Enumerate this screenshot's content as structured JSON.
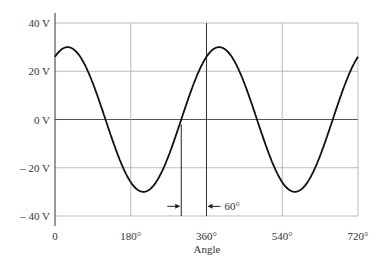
{
  "chart_data": {
    "type": "line",
    "title": "",
    "xlabel": "Angle",
    "ylabel": "",
    "xlim": [
      0,
      720
    ],
    "ylim": [
      -40,
      40
    ],
    "grid": true,
    "x_ticks": [
      0,
      180,
      360,
      540,
      720
    ],
    "x_tick_labels": [
      "0",
      "180°",
      "360°",
      "540°",
      "720°"
    ],
    "y_ticks": [
      40,
      20,
      0,
      -20,
      -40
    ],
    "y_tick_labels": [
      "40 V",
      "20 V",
      "0 V",
      "– 20 V",
      "– 40 V"
    ],
    "series": [
      {
        "name": "v(θ) = 30 sin(θ + 60°)",
        "amplitude": 30,
        "phase_deg": 60,
        "x": [
          0,
          30,
          60,
          90,
          120,
          150,
          180,
          210,
          240,
          270,
          300,
          330,
          360,
          390,
          420,
          450,
          480,
          510,
          540,
          570,
          600,
          630,
          660,
          690,
          720
        ],
        "values": [
          26,
          30,
          26,
          15,
          0,
          -15,
          -26,
          -30,
          -26,
          -15,
          0,
          15,
          26,
          30,
          26,
          15,
          0,
          -15,
          -26,
          -30,
          -26,
          -15,
          0,
          15,
          26
        ]
      }
    ],
    "annotations": [
      {
        "type": "marker-line",
        "x": 300
      },
      {
        "type": "marker-line",
        "x": 360
      },
      {
        "type": "dimension",
        "from": 300,
        "to": 360,
        "label": "60°"
      }
    ]
  }
}
